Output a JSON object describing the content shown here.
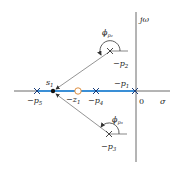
{
  "axes": {
    "imag_label": "jω",
    "real_label": "σ",
    "origin_label": "0"
  },
  "colors": {
    "axis": "#333333",
    "root_locus": "#3a8fd6",
    "arrow": "#555555",
    "zero_fill": "#ffffff",
    "zero_stroke": "#d9822b"
  },
  "poles": [
    {
      "id": "p1",
      "label": "−p",
      "sub": "1"
    },
    {
      "id": "p2",
      "label": "−p",
      "sub": "2"
    },
    {
      "id": "p3",
      "label": "−p",
      "sub": "3"
    },
    {
      "id": "p4",
      "label": "−p",
      "sub": "4"
    },
    {
      "id": "p5",
      "label": "−p",
      "sub": "5"
    }
  ],
  "zeros": [
    {
      "id": "z1",
      "label": "−z",
      "sub": "1"
    }
  ],
  "test_point": {
    "label": "s",
    "sub": "1"
  },
  "angles": [
    {
      "id": "phi_p2",
      "label": "ϕ",
      "sub": "p₂"
    },
    {
      "id": "phi_p3",
      "label": "ϕ",
      "sub": "p₃"
    }
  ]
}
